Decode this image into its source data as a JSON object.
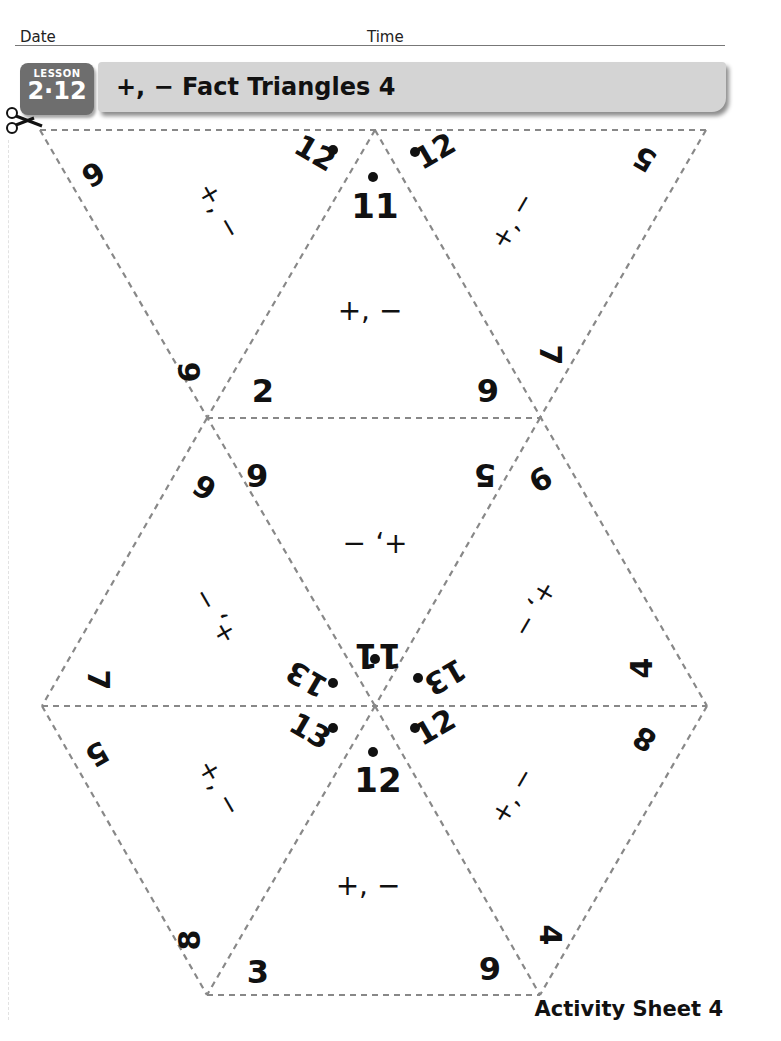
{
  "header": {
    "date_label": "Date",
    "time_label": "Time",
    "lesson_label": "LESSON",
    "lesson_number": "2·12",
    "title": "+, − Fact Triangles 4"
  },
  "footer": {
    "label": "Activity Sheet 4"
  },
  "icons": {
    "scissors": "scissors-icon"
  },
  "colors": {
    "badge": "#6e6e6e",
    "title_bar": "#d4d4d4",
    "cut_line": "#888888"
  },
  "triangles": [
    {
      "row": "top",
      "position": "left",
      "orientation": "inverted",
      "sum": "12",
      "addends": [
        "6",
        "6"
      ],
      "operations": "+, −"
    },
    {
      "row": "top",
      "position": "center",
      "orientation": "upright",
      "sum": "11",
      "addends": [
        "2",
        "9"
      ],
      "operations": "+, −"
    },
    {
      "row": "top",
      "position": "right",
      "orientation": "inverted",
      "sum": "12",
      "addends": [
        "5",
        "7"
      ],
      "operations": "+, −"
    },
    {
      "row": "middle",
      "position": "left",
      "orientation": "upright-rotated",
      "sum": "13",
      "addends": [
        "6",
        "7"
      ],
      "operations": "+, −"
    },
    {
      "row": "middle",
      "position": "center",
      "orientation": "inverted-upside-down",
      "sum": "11",
      "addends": [
        "6",
        "5"
      ],
      "operations": "+, −"
    },
    {
      "row": "middle",
      "position": "right",
      "orientation": "upright-rotated",
      "sum": "13",
      "addends": [
        "9",
        "4"
      ],
      "operations": "+, −"
    },
    {
      "row": "bottom",
      "position": "left",
      "orientation": "inverted",
      "sum": "13",
      "addends": [
        "5",
        "8"
      ],
      "operations": "+, −"
    },
    {
      "row": "bottom",
      "position": "center",
      "orientation": "upright",
      "sum": "12",
      "addends": [
        "3",
        "9"
      ],
      "operations": "+, −"
    },
    {
      "row": "bottom",
      "position": "right",
      "orientation": "inverted",
      "sum": "12",
      "addends": [
        "8",
        "4"
      ],
      "operations": "+, −"
    }
  ]
}
